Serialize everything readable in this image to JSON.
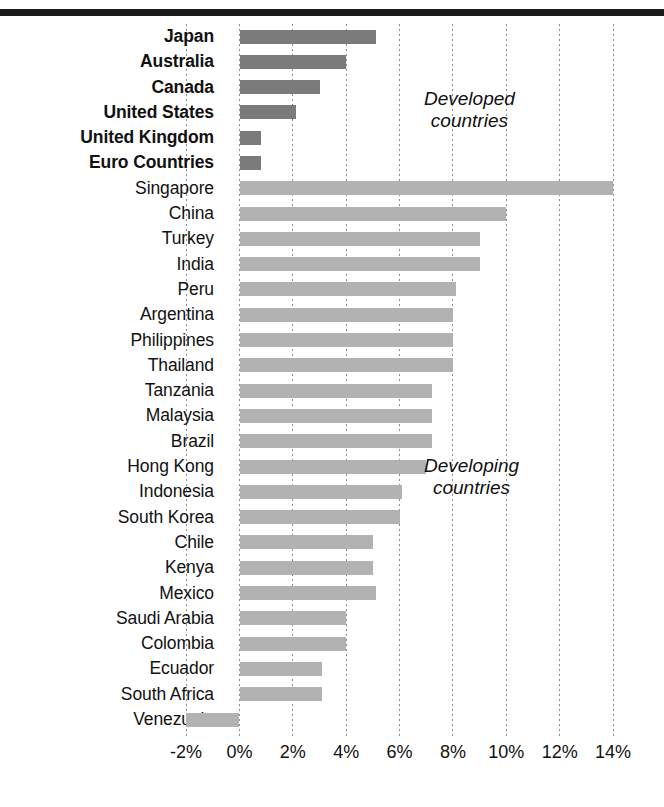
{
  "chart_data": {
    "type": "bar",
    "orientation": "horizontal",
    "title": "",
    "subtitle": "",
    "xlabel": "",
    "ylabel": "",
    "xlim": [
      -2,
      14
    ],
    "xticks": [
      -2,
      0,
      2,
      4,
      6,
      8,
      10,
      12,
      14
    ],
    "xtick_labels": [
      "-2%",
      "0%",
      "2%",
      "4%",
      "6%",
      "8%",
      "10%",
      "12%",
      "14%"
    ],
    "grid": "vertical-dotted",
    "legend": "none",
    "annotations": [
      {
        "text": "Developed\ncountries",
        "group": "developed"
      },
      {
        "text": "Developing\ncountries",
        "group": "developing"
      }
    ],
    "series": [
      {
        "name": "Developed countries",
        "color": "#7b7b7b",
        "bold_labels": true,
        "categories": [
          "Japan",
          "Australia",
          "Canada",
          "United States",
          "United Kingdom",
          "Euro Countries"
        ],
        "values": [
          5.1,
          4.0,
          3.0,
          2.1,
          0.8,
          0.8
        ]
      },
      {
        "name": "Developing countries",
        "color": "#b2b2b2",
        "bold_labels": false,
        "categories": [
          "Singapore",
          "China",
          "Turkey",
          "India",
          "Peru",
          "Argentina",
          "Philippines",
          "Thailand",
          "Tanzania",
          "Malaysia",
          "Brazil",
          "Hong Kong",
          "Indonesia",
          "South Korea",
          "Chile",
          "Kenya",
          "Mexico",
          "Saudi Arabia",
          "Colombia",
          "Ecuador",
          "South Africa",
          "Venezuela"
        ],
        "values": [
          14.0,
          10.0,
          9.0,
          9.0,
          8.1,
          8.0,
          8.0,
          8.0,
          7.2,
          7.2,
          7.2,
          7.0,
          6.1,
          6.0,
          5.0,
          5.0,
          5.1,
          4.0,
          4.0,
          3.1,
          3.1,
          -2.0
        ]
      }
    ],
    "bars": [
      {
        "label": "Japan",
        "value": 5.1,
        "group": "developed"
      },
      {
        "label": "Australia",
        "value": 4.0,
        "group": "developed"
      },
      {
        "label": "Canada",
        "value": 3.0,
        "group": "developed"
      },
      {
        "label": "United States",
        "value": 2.1,
        "group": "developed"
      },
      {
        "label": "United Kingdom",
        "value": 0.8,
        "group": "developed"
      },
      {
        "label": "Euro Countries",
        "value": 0.8,
        "group": "developed"
      },
      {
        "label": "Singapore",
        "value": 14.0,
        "group": "developing"
      },
      {
        "label": "China",
        "value": 10.0,
        "group": "developing"
      },
      {
        "label": "Turkey",
        "value": 9.0,
        "group": "developing"
      },
      {
        "label": "India",
        "value": 9.0,
        "group": "developing"
      },
      {
        "label": "Peru",
        "value": 8.1,
        "group": "developing"
      },
      {
        "label": "Argentina",
        "value": 8.0,
        "group": "developing"
      },
      {
        "label": "Philippines",
        "value": 8.0,
        "group": "developing"
      },
      {
        "label": "Thailand",
        "value": 8.0,
        "group": "developing"
      },
      {
        "label": "Tanzania",
        "value": 7.2,
        "group": "developing"
      },
      {
        "label": "Malaysia",
        "value": 7.2,
        "group": "developing"
      },
      {
        "label": "Brazil",
        "value": 7.2,
        "group": "developing"
      },
      {
        "label": "Hong Kong",
        "value": 7.0,
        "group": "developing"
      },
      {
        "label": "Indonesia",
        "value": 6.1,
        "group": "developing"
      },
      {
        "label": "South Korea",
        "value": 6.0,
        "group": "developing"
      },
      {
        "label": "Chile",
        "value": 5.0,
        "group": "developing"
      },
      {
        "label": "Kenya",
        "value": 5.0,
        "group": "developing"
      },
      {
        "label": "Mexico",
        "value": 5.1,
        "group": "developing"
      },
      {
        "label": "Saudi Arabia",
        "value": 4.0,
        "group": "developing"
      },
      {
        "label": "Colombia",
        "value": 4.0,
        "group": "developing"
      },
      {
        "label": "Ecuador",
        "value": 3.1,
        "group": "developing"
      },
      {
        "label": "South Africa",
        "value": 3.1,
        "group": "developing"
      },
      {
        "label": "Venezuela",
        "value": -2.0,
        "group": "developing"
      }
    ],
    "colors": {
      "developed_bar": "#7b7b7b",
      "developing_bar": "#b2b2b2",
      "gridline": "#8d8d8d",
      "top_rule": "#1a1a1a",
      "text": "#111111",
      "background": "#ffffff"
    }
  },
  "annotations": {
    "developed": "Developed\ncountries",
    "developing": "Developing\ncountries"
  }
}
